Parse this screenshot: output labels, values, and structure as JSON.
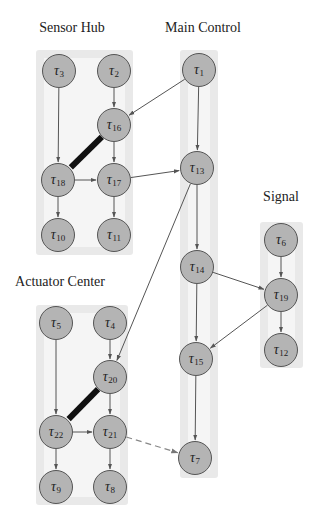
{
  "diagram": {
    "colors": {
      "node_fill": "#b4b4b4",
      "node_stroke": "#555555",
      "group_bg": "#e9e9e9",
      "edge": "#555555",
      "thick_edge": "#111111",
      "dashed_edge": "#888888"
    },
    "symbol": "τ",
    "groups": [
      {
        "id": "sensor_hub",
        "title": "Sensor Hub",
        "title_x": 72,
        "title_y": 20,
        "box": [
          36,
          50,
          97,
          205
        ],
        "nodes": [
          "3",
          "2",
          "16",
          "18",
          "17",
          "10",
          "11"
        ]
      },
      {
        "id": "main_control",
        "title": "Main Control",
        "title_x": 203,
        "title_y": 20,
        "box": [
          180,
          50,
          38,
          428
        ],
        "nodes": [
          "1",
          "13",
          "14",
          "15",
          "7"
        ]
      },
      {
        "id": "signal",
        "title": "Signal",
        "title_x": 281,
        "title_y": 189,
        "box": [
          260,
          222,
          43,
          146
        ],
        "nodes": [
          "6",
          "19",
          "12"
        ]
      },
      {
        "id": "actuator_center",
        "title": "Actuator Center",
        "title_x": 60,
        "title_y": 274,
        "box": [
          36,
          305,
          92,
          200
        ],
        "nodes": [
          "5",
          "4",
          "20",
          "22",
          "21",
          "9",
          "8"
        ]
      }
    ],
    "nodes": [
      {
        "id": "3",
        "label": "3",
        "x": 59,
        "y": 71
      },
      {
        "id": "2",
        "label": "2",
        "x": 114,
        "y": 71
      },
      {
        "id": "16",
        "label": "16",
        "x": 114,
        "y": 125
      },
      {
        "id": "18",
        "label": "18",
        "x": 58,
        "y": 180
      },
      {
        "id": "17",
        "label": "17",
        "x": 114,
        "y": 180
      },
      {
        "id": "10",
        "label": "10",
        "x": 58,
        "y": 235
      },
      {
        "id": "11",
        "label": "11",
        "x": 114,
        "y": 235
      },
      {
        "id": "1",
        "label": "1",
        "x": 199,
        "y": 70
      },
      {
        "id": "13",
        "label": "13",
        "x": 197,
        "y": 168
      },
      {
        "id": "14",
        "label": "14",
        "x": 197,
        "y": 267
      },
      {
        "id": "15",
        "label": "15",
        "x": 196,
        "y": 359
      },
      {
        "id": "7",
        "label": "7",
        "x": 195,
        "y": 458
      },
      {
        "id": "6",
        "label": "6",
        "x": 281,
        "y": 240
      },
      {
        "id": "19",
        "label": "19",
        "x": 281,
        "y": 295
      },
      {
        "id": "12",
        "label": "12",
        "x": 281,
        "y": 350
      },
      {
        "id": "5",
        "label": "5",
        "x": 56,
        "y": 323
      },
      {
        "id": "4",
        "label": "4",
        "x": 110,
        "y": 323
      },
      {
        "id": "20",
        "label": "20",
        "x": 110,
        "y": 377
      },
      {
        "id": "22",
        "label": "22",
        "x": 56,
        "y": 432
      },
      {
        "id": "21",
        "label": "21",
        "x": 110,
        "y": 432
      },
      {
        "id": "9",
        "label": "9",
        "x": 56,
        "y": 487
      },
      {
        "id": "8",
        "label": "8",
        "x": 110,
        "y": 487
      }
    ],
    "edges": [
      {
        "from": "3",
        "to": "18",
        "style": "arrow"
      },
      {
        "from": "2",
        "to": "16",
        "style": "arrow"
      },
      {
        "from": "16",
        "to": "17",
        "style": "arrow"
      },
      {
        "from": "16",
        "to": "18",
        "style": "thick"
      },
      {
        "from": "18",
        "to": "17",
        "style": "arrow"
      },
      {
        "from": "18",
        "to": "10",
        "style": "arrow"
      },
      {
        "from": "17",
        "to": "11",
        "style": "arrow"
      },
      {
        "from": "1",
        "to": "16",
        "style": "arrow"
      },
      {
        "from": "17",
        "to": "13",
        "style": "arrow"
      },
      {
        "from": "1",
        "to": "13",
        "style": "arrow"
      },
      {
        "from": "13",
        "to": "14",
        "style": "arrow"
      },
      {
        "from": "13",
        "to": "20",
        "style": "arrow"
      },
      {
        "from": "14",
        "to": "15",
        "style": "arrow"
      },
      {
        "from": "14",
        "to": "19",
        "style": "arrow"
      },
      {
        "from": "6",
        "to": "19",
        "style": "arrow"
      },
      {
        "from": "19",
        "to": "12",
        "style": "arrow"
      },
      {
        "from": "19",
        "to": "15",
        "style": "arrow"
      },
      {
        "from": "15",
        "to": "7",
        "style": "arrow"
      },
      {
        "from": "5",
        "to": "22",
        "style": "arrow"
      },
      {
        "from": "4",
        "to": "20",
        "style": "arrow"
      },
      {
        "from": "20",
        "to": "21",
        "style": "arrow"
      },
      {
        "from": "20",
        "to": "22",
        "style": "thick"
      },
      {
        "from": "22",
        "to": "21",
        "style": "arrow"
      },
      {
        "from": "22",
        "to": "9",
        "style": "arrow"
      },
      {
        "from": "21",
        "to": "8",
        "style": "arrow"
      },
      {
        "from": "21",
        "to": "7",
        "style": "dashed"
      }
    ]
  }
}
